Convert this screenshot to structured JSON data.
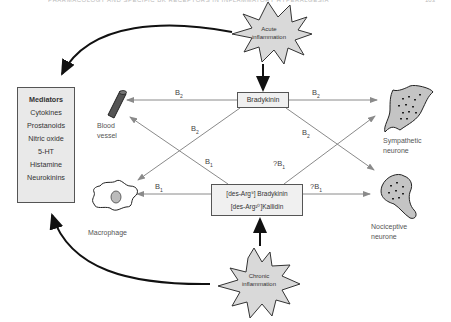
{
  "page_header": {
    "text": "PHARMACOLOGY AND SPECIFIC BK RECEPTORS IN INFLAMMATORY HYPERALGESIA",
    "page_number": "103"
  },
  "triggers": {
    "acute": {
      "line1": "Acute",
      "line2": "inflammation"
    },
    "chronic": {
      "line1": "Chronic",
      "line2": "inflammation"
    }
  },
  "ligands": {
    "bradykinin": "Bradykinin",
    "des_bk": "[des-Arg⁹] Bradykinin",
    "des_kallidin": "[des-Arg¹⁰]Kallidin"
  },
  "mediators": {
    "title": "Mediators",
    "items": [
      "Cytokines",
      "Prostanoids",
      "Nitric oxide",
      "5-HT",
      "Histamine",
      "Neurokinins"
    ]
  },
  "targets": {
    "blood_vessel": {
      "line1": "Blood",
      "line2": "vessel"
    },
    "macrophage": {
      "line1": "Macrophage"
    },
    "sympathetic": {
      "line1": "Sympathetic",
      "line2": "neurone"
    },
    "nociceptive": {
      "line1": "Nociceptive",
      "line2": "neurone"
    }
  },
  "receptor_labels": {
    "bk_to_vessel": "B",
    "bk_to_vessel_sub": "2",
    "bk_to_symp": "B",
    "bk_to_symp_sub": "2",
    "bk_to_macro_diag": "B",
    "bk_to_macro_diag_sub": "2",
    "bk_to_noci_diag": "B",
    "bk_to_noci_diag_sub": "2",
    "des_to_vessel_diag": "B",
    "des_to_vessel_diag_sub": "1",
    "des_to_macro": "B",
    "des_to_macro_sub": "1",
    "des_to_symp_diag": "?B",
    "des_to_symp_diag_sub": "1",
    "des_to_noci": "?B",
    "des_to_noci_sub": "1"
  },
  "colors": {
    "box_fill": "#f0f0f0",
    "mediator_fill": "#e9e9e9",
    "star_fill": "#d9d9d9",
    "arrow_grey": "#8a8a8a",
    "arrow_black": "#111111"
  }
}
